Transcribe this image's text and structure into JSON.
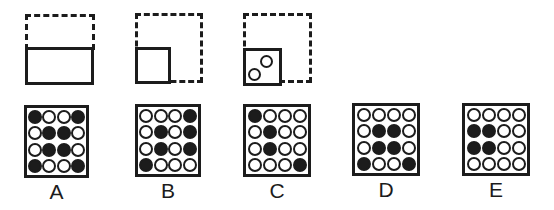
{
  "colors": {
    "ink": "#1c1c1c",
    "paper": "#ffffff"
  },
  "stimulus": {
    "panels": [
      {
        "name": "panel-1",
        "shapes": [
          "dashed-rectangle",
          "solid-rectangle"
        ]
      },
      {
        "name": "panel-2",
        "shapes": [
          "dashed-square",
          "solid-square"
        ]
      },
      {
        "name": "panel-3",
        "shapes": [
          "dashed-square",
          "solid-square",
          "circle",
          "circle"
        ]
      }
    ]
  },
  "options": [
    {
      "label": "A",
      "grid": [
        [
          1,
          0,
          0,
          1
        ],
        [
          0,
          1,
          1,
          0
        ],
        [
          0,
          1,
          1,
          0
        ],
        [
          1,
          0,
          0,
          1
        ]
      ]
    },
    {
      "label": "B",
      "grid": [
        [
          0,
          0,
          0,
          1
        ],
        [
          0,
          1,
          0,
          1
        ],
        [
          0,
          1,
          0,
          1
        ],
        [
          1,
          0,
          0,
          0
        ]
      ]
    },
    {
      "label": "C",
      "grid": [
        [
          1,
          0,
          0,
          0
        ],
        [
          0,
          1,
          0,
          0
        ],
        [
          0,
          1,
          0,
          0
        ],
        [
          0,
          0,
          0,
          1
        ]
      ]
    },
    {
      "label": "D",
      "grid": [
        [
          0,
          0,
          0,
          0
        ],
        [
          0,
          1,
          1,
          0
        ],
        [
          0,
          1,
          1,
          0
        ],
        [
          1,
          0,
          0,
          1
        ]
      ]
    },
    {
      "label": "E",
      "grid": [
        [
          0,
          0,
          0,
          0
        ],
        [
          1,
          1,
          0,
          0
        ],
        [
          1,
          1,
          0,
          0
        ],
        [
          0,
          0,
          0,
          0
        ]
      ]
    }
  ]
}
